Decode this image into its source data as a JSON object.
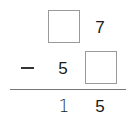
{
  "problem": {
    "operation": "subtraction",
    "row1": {
      "tens": "",
      "ones": "7"
    },
    "row2": {
      "operator": "−",
      "tens": "5",
      "ones": ""
    },
    "result": {
      "tens": "1",
      "ones": "5"
    }
  }
}
